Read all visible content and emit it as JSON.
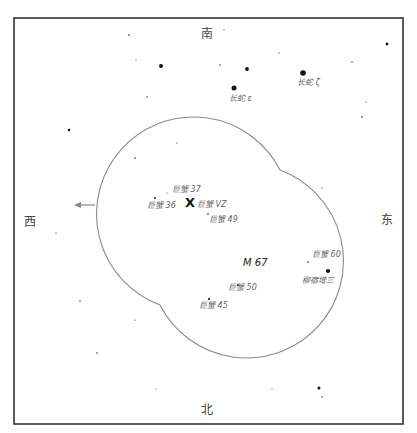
{
  "directions": {
    "south": "南",
    "north": "北",
    "west": "西",
    "east": "东"
  },
  "target": {
    "label": "M 67",
    "marker": "X",
    "marker_star": "巨蟹 VZ"
  },
  "labels": {
    "hya_epsilon": "长蛇 ε",
    "hya_zeta": "长蛇 ζ",
    "cnc37": "巨蟹 37",
    "cnc36": "巨蟹 36",
    "cnc49": "巨蟹 49",
    "cnc60": "巨蟹 60",
    "cnc50": "巨蟹 50",
    "cnc45": "巨蟹 45",
    "acubens": "柳宿增三"
  },
  "colors": {
    "frame": "#333333",
    "fov_outline": "#8a8a8a",
    "star": "#111111",
    "label": "#666666"
  },
  "stars": [
    {
      "x": 129,
      "y": 35,
      "r": 0.8
    },
    {
      "x": 224,
      "y": 30,
      "r": 0.6
    },
    {
      "x": 387,
      "y": 44,
      "r": 1.4
    },
    {
      "x": 136,
      "y": 60,
      "r": 0.6
    },
    {
      "x": 161,
      "y": 66,
      "r": 2.0
    },
    {
      "x": 220,
      "y": 65,
      "r": 0.7
    },
    {
      "x": 247,
      "y": 69,
      "r": 1.9
    },
    {
      "x": 303,
      "y": 73,
      "r": 2.8
    },
    {
      "x": 279,
      "y": 53,
      "r": 0.6
    },
    {
      "x": 352,
      "y": 62,
      "r": 0.7
    },
    {
      "x": 234,
      "y": 88,
      "r": 2.5
    },
    {
      "x": 147,
      "y": 97,
      "r": 0.7
    },
    {
      "x": 366,
      "y": 102,
      "r": 0.6
    },
    {
      "x": 362,
      "y": 117,
      "r": 0.8
    },
    {
      "x": 69,
      "y": 130,
      "r": 1.3
    },
    {
      "x": 135,
      "y": 158,
      "r": 0.8
    },
    {
      "x": 177,
      "y": 143,
      "r": 0.6
    },
    {
      "x": 322,
      "y": 188,
      "r": 0.6
    },
    {
      "x": 155,
      "y": 198,
      "r": 0.9
    },
    {
      "x": 167,
      "y": 193,
      "r": 0.5
    },
    {
      "x": 208,
      "y": 214,
      "r": 0.8
    },
    {
      "x": 56,
      "y": 233,
      "r": 0.6
    },
    {
      "x": 308,
      "y": 262,
      "r": 0.8
    },
    {
      "x": 328,
      "y": 271,
      "r": 2.0
    },
    {
      "x": 238,
      "y": 285,
      "r": 1.1
    },
    {
      "x": 209,
      "y": 299,
      "r": 1.1
    },
    {
      "x": 80,
      "y": 301,
      "r": 0.7
    },
    {
      "x": 135,
      "y": 320,
      "r": 0.6
    },
    {
      "x": 97,
      "y": 353,
      "r": 0.7
    },
    {
      "x": 156,
      "y": 389,
      "r": 0.5
    },
    {
      "x": 272,
      "y": 389,
      "r": 0.5
    },
    {
      "x": 319,
      "y": 388,
      "r": 1.5
    },
    {
      "x": 322,
      "y": 397,
      "r": 0.7
    }
  ]
}
